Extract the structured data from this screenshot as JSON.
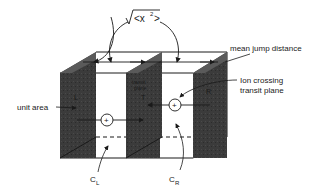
{
  "diagram": {
    "formula": "√<x²>",
    "formula_radicand": "<x",
    "formula_exponent": "2",
    "formula_close": ">",
    "labels": {
      "mean_jump_distance": "mean jump distance",
      "ion_crossing_line1": "Ion crossing",
      "ion_crossing_line2": "transit plane",
      "unit_area": "unit area",
      "plane_left": "L",
      "plane_transit_line1": "transit",
      "plane_transit_line2": "plane",
      "plane_transit_symbol": "T",
      "plane_right": "R",
      "conc_left": "C",
      "conc_left_sub": "L",
      "conc_right": "C",
      "conc_right_sub": "R",
      "ion_symbol": "+"
    },
    "colors": {
      "plane_fill": "#3a3a3a",
      "plane_top": "#555555",
      "line": "#1a1a1a",
      "background": "#ffffff"
    }
  }
}
